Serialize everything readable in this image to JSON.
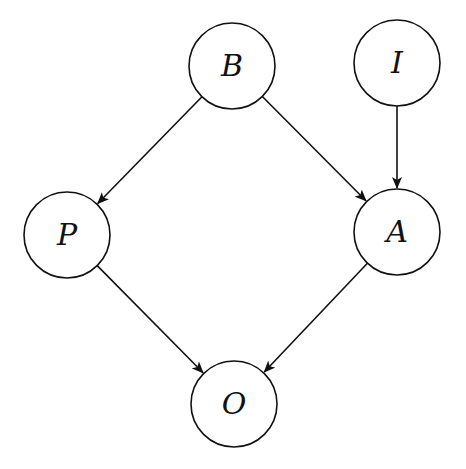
{
  "diagram": {
    "type": "directed-graph",
    "nodes": [
      {
        "id": "B",
        "label": "B",
        "cx": 232,
        "cy": 66,
        "r": 43
      },
      {
        "id": "I",
        "label": "I",
        "cx": 397,
        "cy": 63,
        "r": 43
      },
      {
        "id": "P",
        "label": "P",
        "cx": 67,
        "cy": 235,
        "r": 43
      },
      {
        "id": "A",
        "label": "A",
        "cx": 397,
        "cy": 232,
        "r": 43
      },
      {
        "id": "O",
        "label": "O",
        "cx": 234,
        "cy": 404,
        "r": 43
      }
    ],
    "edges": [
      {
        "from": "B",
        "to": "P"
      },
      {
        "from": "B",
        "to": "A"
      },
      {
        "from": "I",
        "to": "A"
      },
      {
        "from": "P",
        "to": "O"
      },
      {
        "from": "A",
        "to": "O"
      }
    ],
    "colors": {
      "stroke": "#111111",
      "fill": "#ffffff"
    }
  }
}
